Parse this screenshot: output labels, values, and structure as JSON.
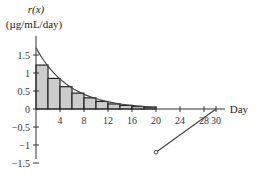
{
  "chart_data": {
    "type": "bar",
    "title": "",
    "ylabel_line1": "r(x)",
    "ylabel_line2": "(µg/mL/day)",
    "xlabel": "Day",
    "xlim": [
      0,
      30
    ],
    "ylim": [
      -1.5,
      1.7
    ],
    "grid": false,
    "x_ticks": [
      4,
      8,
      12,
      16,
      20,
      24,
      28,
      30
    ],
    "x_tick_labels": [
      "4",
      "8",
      "12",
      "16",
      "20",
      "24",
      "28",
      "30"
    ],
    "y_ticks": [
      1.5,
      1,
      0.5,
      0,
      -0.5,
      -1,
      -1.5
    ],
    "y_tick_labels": [
      "1.5",
      "1",
      "0.5",
      "0",
      "−0.5",
      "−1",
      "−1.5"
    ],
    "bars": {
      "name": "Right-endpoint rectangles (2-day width)",
      "x_left": [
        0,
        2,
        4,
        6,
        8,
        10,
        12,
        14,
        16,
        18
      ],
      "width": 2,
      "values": [
        1.22,
        0.85,
        0.62,
        0.44,
        0.31,
        0.21,
        0.14,
        0.1,
        0.07,
        0.05
      ],
      "fill": "#cccccc",
      "stroke": "#222222"
    },
    "series": [
      {
        "name": "r(x) decaying curve",
        "kind": "line",
        "x": [
          0,
          2,
          4,
          6,
          8,
          10,
          12,
          14,
          16,
          18,
          20
        ],
        "values": [
          1.7,
          1.19,
          0.83,
          0.58,
          0.4,
          0.28,
          0.2,
          0.14,
          0.1,
          0.07,
          0.05
        ]
      },
      {
        "name": "r(x) linear segment",
        "kind": "line",
        "x": [
          20,
          30
        ],
        "values": [
          -1.2,
          0
        ],
        "start_marker": "open-circle"
      }
    ]
  }
}
